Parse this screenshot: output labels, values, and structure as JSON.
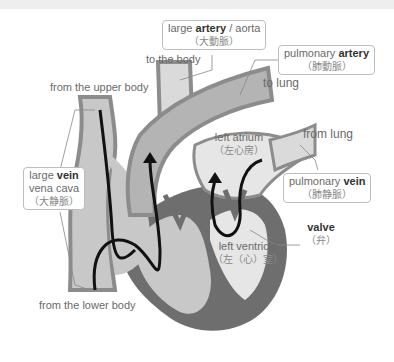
{
  "diagram": {
    "type": "heart-blood-flow",
    "colors": {
      "vessel_fill": "#c8c8c8",
      "vessel_edge": "#8c8c8c",
      "chamber_light": "#e6e6e6",
      "muscle_dark": "#6e6e6e",
      "arrow": "#111111",
      "label_text": "#6a6a6a",
      "bold_text": "#333333",
      "box_border": "#bdbdbd"
    },
    "labels": {
      "aorta": {
        "pre": "large ",
        "bold": "artery",
        "post": " / aorta",
        "jp": "（大動脈）"
      },
      "to_body": "to the body",
      "pulmonary_artery": {
        "pre": "pulmonary ",
        "bold": "artery",
        "jp": "（肺動脈）"
      },
      "to_lung": "to lung",
      "from_upper_body": "from the upper body",
      "vena_cava": {
        "pre": "large ",
        "bold": "vein",
        "line2": "vena cava",
        "jp": "（大静脈）"
      },
      "left_atrium": {
        "en": "left atrium",
        "jp": "（左心房）"
      },
      "from_lung": "from lung",
      "pulmonary_vein": {
        "pre": "pulmonary ",
        "bold": "vein",
        "jp": "（肺静脈）"
      },
      "valve": {
        "bold": "valve",
        "jp": "（弁）"
      },
      "left_ventricle": {
        "en": "left ventricle",
        "jp": "（左（心）室）"
      },
      "from_lower_body": "from the lower body"
    }
  }
}
